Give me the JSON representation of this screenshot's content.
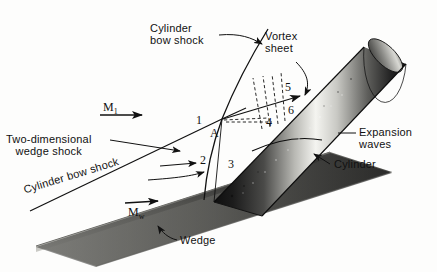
{
  "figure": {
    "type": "technical-diagram",
    "background_color": "#fdfdfc",
    "ink_color": "#111111"
  },
  "labels": {
    "cylinder_bow_shock_top": "Cylinder\nbow shock",
    "vortex_sheet": "Vortex\nsheet",
    "two_dimensional_wedge_shock": "Two-dimensional\nwedge shock",
    "cylinder_bow_shock_lower": "Cylinder bow shock",
    "expansion_waves": "Expansion\nwaves",
    "cylinder": "Cylinder",
    "wedge": "Wedge"
  },
  "mach_numbers": {
    "freestream": {
      "symbol": "M",
      "subscript": "1"
    },
    "wedge": {
      "symbol": "M",
      "subscript": "w"
    }
  },
  "regions": {
    "point_label": "A",
    "numbers": [
      "1",
      "2",
      "3",
      "4",
      "5",
      "6"
    ]
  },
  "colors": {
    "ink": "#111111",
    "paper": "#fdfdfc",
    "cylinder_dark": "#1a1a1a",
    "cylinder_light": "#f2f2f0",
    "wedge_dark": "#2b2b2b",
    "wedge_light": "#dcdcda"
  }
}
